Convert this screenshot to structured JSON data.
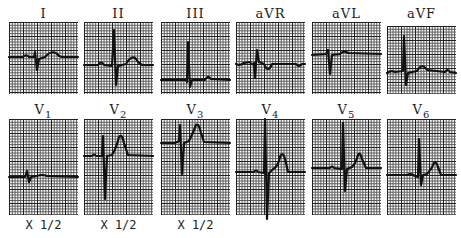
{
  "figure": {
    "limb_leads": [
      {
        "id": "I",
        "label": "I",
        "sub": "",
        "scale": ""
      },
      {
        "id": "II",
        "label": "II",
        "sub": "",
        "scale": ""
      },
      {
        "id": "III",
        "label": "III",
        "sub": "",
        "scale": ""
      },
      {
        "id": "aVR",
        "label": "aVR",
        "sub": "",
        "scale": ""
      },
      {
        "id": "aVL",
        "label": "aVL",
        "sub": "",
        "scale": ""
      },
      {
        "id": "aVF",
        "label": "aVF",
        "sub": "",
        "scale": ""
      }
    ],
    "precordial_leads": [
      {
        "id": "V1",
        "label": "V",
        "sub": "1",
        "scale": "X 1/2"
      },
      {
        "id": "V2",
        "label": "V",
        "sub": "2",
        "scale": "X 1/2"
      },
      {
        "id": "V3",
        "label": "V",
        "sub": "3",
        "scale": "X 1/2"
      },
      {
        "id": "V4",
        "label": "V",
        "sub": "4",
        "scale": ""
      },
      {
        "id": "V5",
        "label": "V",
        "sub": "5",
        "scale": ""
      },
      {
        "id": "V6",
        "label": "V",
        "sub": "6",
        "scale": ""
      }
    ],
    "colors": {
      "trace": "#111111",
      "grid_major": "#222222",
      "grid_minor": "#555555",
      "background": "#ffffff"
    }
  }
}
